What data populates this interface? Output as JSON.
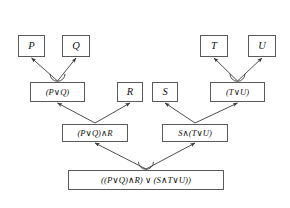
{
  "diagram": {
    "background_color": "#ffffff",
    "box_border_color": "#5a5a5a",
    "edge_color": "#3a3a3a",
    "text_color": "#111111",
    "nodes": [
      {
        "id": "p",
        "label": "P",
        "row": 1,
        "x": 18,
        "y": 35,
        "w": 27,
        "h": 22
      },
      {
        "id": "q",
        "label": "Q",
        "row": 1,
        "x": 62,
        "y": 35,
        "w": 28,
        "h": 22
      },
      {
        "id": "t",
        "label": "T",
        "row": 1,
        "x": 200,
        "y": 35,
        "w": 28,
        "h": 22
      },
      {
        "id": "u",
        "label": "U",
        "row": 1,
        "x": 248,
        "y": 35,
        "w": 28,
        "h": 22
      },
      {
        "id": "pq",
        "label": "(P∨Q)",
        "row": 2,
        "x": 30,
        "y": 82,
        "w": 55,
        "h": 20
      },
      {
        "id": "r",
        "label": "R",
        "row": 2,
        "x": 117,
        "y": 82,
        "w": 26,
        "h": 20
      },
      {
        "id": "s",
        "label": "S",
        "row": 2,
        "x": 152,
        "y": 82,
        "w": 26,
        "h": 20
      },
      {
        "id": "tu",
        "label": "(T∨U)",
        "row": 2,
        "x": 210,
        "y": 82,
        "w": 55,
        "h": 20
      },
      {
        "id": "pqr",
        "label": "(P∨Q)∧R",
        "row": 3,
        "x": 62,
        "y": 124,
        "w": 66,
        "h": 18
      },
      {
        "id": "stu",
        "label": "S∧(T∨U)",
        "row": 3,
        "x": 162,
        "y": 124,
        "w": 66,
        "h": 18
      },
      {
        "id": "root",
        "label": "((P∨Q)∧R) ∨ (S∧T∨U))",
        "row": 4,
        "x": 68,
        "y": 170,
        "w": 156,
        "h": 20
      }
    ],
    "edges": [
      {
        "from": "pq",
        "to": "p",
        "junction": true
      },
      {
        "from": "pq",
        "to": "q",
        "junction": true
      },
      {
        "from": "tu",
        "to": "t",
        "junction": true
      },
      {
        "from": "tu",
        "to": "u",
        "junction": true
      },
      {
        "from": "pqr",
        "to": "pq",
        "junction": false
      },
      {
        "from": "pqr",
        "to": "r",
        "junction": false
      },
      {
        "from": "stu",
        "to": "s",
        "junction": false
      },
      {
        "from": "stu",
        "to": "tu",
        "junction": false
      },
      {
        "from": "root",
        "to": "pqr",
        "junction": true
      },
      {
        "from": "root",
        "to": "stu",
        "junction": true
      }
    ]
  }
}
